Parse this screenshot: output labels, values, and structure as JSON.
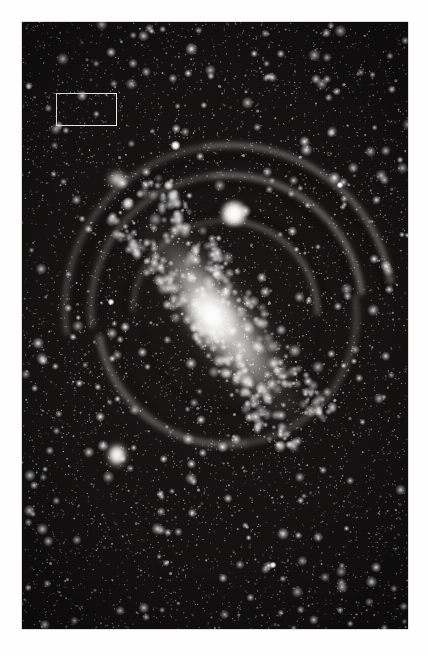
{
  "page": {
    "background_color": "#fefefe",
    "width": 428,
    "height": 656,
    "caption": ""
  },
  "plate": {
    "name": "andromeda-galaxy-photographic-plate",
    "medium": "black-and-white astronomical photograph",
    "background_color": "#0a0909",
    "highlight_color": "#ffffff",
    "x": 22,
    "y": 22,
    "width": 386,
    "height": 607
  },
  "annotation": {
    "shape": "rectangle",
    "stroke_color": "#f2f2f0",
    "stroke_width": 1,
    "x": 56,
    "y": 93,
    "width": 61,
    "height": 33,
    "label": ""
  },
  "objects": [
    {
      "name": "galaxy-core",
      "kind": "nucleus",
      "x": 219,
      "y": 294,
      "brightness": "saturated-white"
    },
    {
      "name": "companion-galaxy-m32",
      "kind": "elliptical-companion",
      "x": 212,
      "y": 191,
      "brightness": "bright"
    },
    {
      "name": "companion-galaxy-m110",
      "kind": "elliptical-companion",
      "x": 95,
      "y": 433,
      "brightness": "moderate"
    },
    {
      "name": "star-cloud-ngc206",
      "kind": "star-cloud",
      "x": 95,
      "y": 157,
      "brightness": "moderate"
    },
    {
      "name": "foreground-star-bright",
      "kind": "foreground-star",
      "x": 175,
      "y": 145,
      "brightness": "bright"
    }
  ],
  "chart_data": {
    "type": "scatter",
    "title": "",
    "xlabel": "",
    "ylabel": "",
    "grid": false,
    "legend": "none"
  }
}
